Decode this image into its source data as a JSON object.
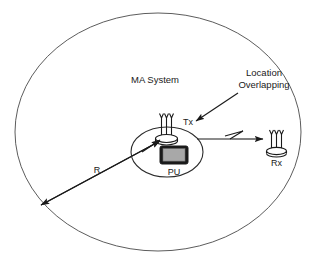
{
  "figure": {
    "title_text": "MA System",
    "annotation_text_line1": "Location",
    "annotation_text_line2": "Overlapping",
    "radius_label": "R",
    "tx_label": "Tx",
    "rx_label": "Rx",
    "pu_label": "PU"
  },
  "icons": {
    "tx_antenna": "antenna-icon",
    "rx_antenna": "antenna-icon",
    "pu_device": "monitor-device-icon",
    "signal": "lightning-signal-icon",
    "radius_arrow": "arrow-icon",
    "annotation_arrow": "arrow-icon",
    "link_arrow": "arrow-icon"
  },
  "colors": {
    "background": "#ffffff",
    "outer_boundary": "#4a4a4a",
    "cell_boundary": "#2b2b2b",
    "line": "#1a1a1a",
    "text": "#1a1a1a",
    "device_screen": "#a8a8a8",
    "device_body": "#1a1a1a"
  },
  "geometry": {
    "outer_region_label": "coverage-ellipse",
    "cell_region_label": "ma-system-cell-ellipse"
  }
}
